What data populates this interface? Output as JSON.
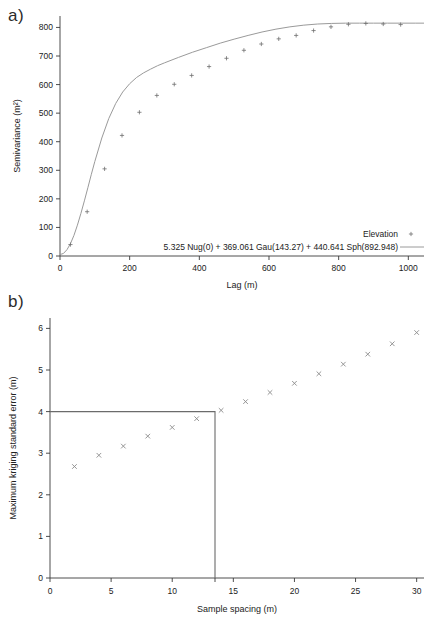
{
  "figure": {
    "panel_a_label": "a)",
    "panel_b_label": "b)"
  },
  "chart_data": [
    {
      "type": "line",
      "panel": "a",
      "title": "",
      "xlabel": "Lag (m)",
      "ylabel": "Semivariance (m²)",
      "xlim": [
        0,
        1045
      ],
      "ylim": [
        0,
        840
      ],
      "xticks": [
        0,
        200,
        400,
        600,
        800,
        1000
      ],
      "xticklabels": [
        "0",
        "200",
        "400",
        "600",
        "800",
        "1000"
      ],
      "yticks": [
        0,
        100,
        200,
        300,
        400,
        500,
        600,
        700,
        800
      ],
      "yticklabels": [
        "0",
        "100",
        "200",
        "300",
        "400",
        "500",
        "600",
        "700",
        "800"
      ],
      "grid": false,
      "legend_position": "lower-right",
      "legend": [
        {
          "name": "Elevation",
          "marker": "plus-marker",
          "style": "points"
        },
        {
          "name": "5.325 Nug(0) + 369.061 Gau(143.27) + 440.641 Sph(892.948)",
          "marker": "line-sample",
          "style": "line"
        }
      ],
      "model": {
        "equation": "5.325 Nug(0) + 369.061 Gau(143.27) + 440.641 Sph(892.948)",
        "nugget": 5.325,
        "gaussian_sill": 369.061,
        "gaussian_range": 143.27,
        "spherical_sill": 440.641,
        "spherical_range": 892.948,
        "total_sill": 815.027
      },
      "series": [
        {
          "name": "Elevation",
          "marker": "plus-marker",
          "x": [
            30,
            78,
            128,
            178,
            228,
            278,
            328,
            378,
            428,
            478,
            528,
            578,
            628,
            678,
            728,
            778,
            828,
            878,
            928,
            978
          ],
          "y": [
            40,
            155,
            305,
            422,
            503,
            562,
            601,
            632,
            663,
            692,
            720,
            742,
            760,
            772,
            789,
            802,
            811,
            814,
            812,
            810
          ]
        },
        {
          "name": "Fitted model",
          "style": "line",
          "x": [
            0,
            10,
            20,
            30,
            40,
            50,
            60,
            70,
            80,
            90,
            100,
            120,
            140,
            160,
            180,
            200,
            220,
            240,
            260,
            280,
            300,
            340,
            380,
            420,
            460,
            500,
            540,
            580,
            620,
            660,
            700,
            740,
            780,
            820,
            860,
            900,
            940,
            980,
            1020,
            1045
          ],
          "y": [
            5,
            9,
            22,
            43,
            72,
            108,
            149,
            193,
            239,
            286,
            331,
            413,
            481,
            534,
            574,
            603,
            625,
            641,
            654,
            666,
            676,
            695,
            713,
            729,
            745,
            759,
            772,
            784,
            794,
            802,
            808,
            812,
            814,
            815,
            815,
            815,
            815,
            815,
            815,
            815
          ]
        }
      ]
    },
    {
      "type": "scatter",
      "panel": "b",
      "title": "",
      "xlabel": "Sample spacing (m)",
      "ylabel": "Maximum kriging standard error (m)",
      "xlim": [
        0,
        30.6
      ],
      "ylim": [
        0,
        6.25
      ],
      "xticks": [
        0,
        5,
        10,
        15,
        20,
        25,
        30
      ],
      "xticklabels": [
        "0",
        "5",
        "10",
        "15",
        "20",
        "25",
        "30"
      ],
      "yticks": [
        0,
        1,
        2,
        3,
        4,
        5,
        6
      ],
      "yticklabels": [
        "0",
        "1",
        "2",
        "3",
        "4",
        "5",
        "6"
      ],
      "extra_xticks": [
        13.5
      ],
      "grid": false,
      "legend_position": "none",
      "reference_box": {
        "x": 13.5,
        "y": 4.0,
        "description": "threshold-box"
      },
      "series": [
        {
          "name": "Maximum kriging standard error",
          "marker": "cross-marker",
          "x": [
            2,
            4,
            6,
            8,
            10,
            12,
            14,
            16,
            18,
            20,
            22,
            24,
            26,
            28,
            30
          ],
          "y": [
            2.68,
            2.95,
            3.17,
            3.41,
            3.62,
            3.83,
            4.03,
            4.24,
            4.46,
            4.68,
            4.91,
            5.14,
            5.38,
            5.63,
            5.9
          ]
        }
      ]
    }
  ]
}
